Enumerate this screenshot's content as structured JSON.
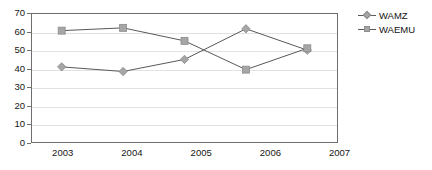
{
  "chart_data": {
    "type": "line",
    "title": "",
    "xlabel": "",
    "ylabel": "",
    "categories": [
      "2003",
      "2004",
      "2005",
      "2006",
      "2007"
    ],
    "ylim": [
      0,
      70
    ],
    "yticks": [
      0,
      10,
      20,
      30,
      40,
      50,
      60,
      70
    ],
    "grid": true,
    "legend_position": "right",
    "series": [
      {
        "name": "WAMZ",
        "marker": "diamond",
        "color": "#a6a6a6",
        "line_color": "#595959",
        "values": [
          41,
          38.5,
          45,
          61.5,
          50
        ]
      },
      {
        "name": "WAEMU",
        "marker": "square",
        "color": "#a6a6a6",
        "line_color": "#595959",
        "values": [
          60.5,
          62,
          55,
          39.5,
          51
        ]
      }
    ]
  },
  "legend": {
    "items": [
      {
        "label": "WAMZ",
        "marker": "diamond"
      },
      {
        "label": "WAEMU",
        "marker": "square"
      }
    ]
  },
  "axes": {
    "y_tick_labels": [
      "70",
      "60",
      "50",
      "40",
      "30",
      "20",
      "10",
      "0"
    ],
    "x_tick_labels": [
      "2003",
      "2004",
      "2005",
      "2006",
      "2007"
    ]
  },
  "colors": {
    "marker": "#a6a6a6",
    "marker_border": "#8c8c8c",
    "line": "#595959",
    "frame": "#6e6e6e",
    "grid": "#e2e2e2",
    "text": "#161616"
  }
}
